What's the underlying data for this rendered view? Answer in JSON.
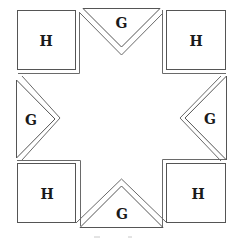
{
  "figure": {
    "pieces": {
      "square_top_left": {
        "label": "H"
      },
      "square_top_right": {
        "label": "H"
      },
      "square_bottom_left": {
        "label": "H"
      },
      "square_bottom_right": {
        "label": "H"
      },
      "triangle_top": {
        "label": "G"
      },
      "triangle_left": {
        "label": "G"
      },
      "triangle_right": {
        "label": "G"
      },
      "triangle_bottom": {
        "label": "G"
      }
    },
    "colors": {
      "stroke": "#555555",
      "label": "#1a1a1a",
      "background": "#ffffff"
    }
  }
}
